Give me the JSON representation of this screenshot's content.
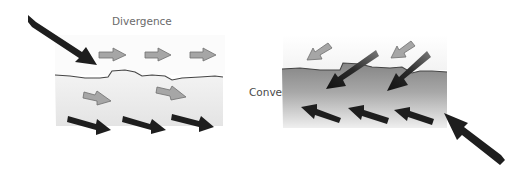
{
  "diagram": {
    "panels": [
      {
        "id": "divergence",
        "label": "Divergence",
        "water_colors": {
          "top": "#f2f2f2",
          "bottom": "#e6e6e6"
        },
        "arrows": {
          "wind": "large black arrow from upper-left pointing down-right toward surface",
          "surface": "three gray arrows pointing right, moving away",
          "subsurface_gray": "two gray arrows pointing right",
          "deep": "three black arrows pointing right-down"
        }
      },
      {
        "id": "convergence",
        "label": "Convergence",
        "water_colors": {
          "top": "#8a8a8a",
          "bottom": "#ececec"
        },
        "arrows": {
          "wind": "large black arrow from lower-right pointing up-left",
          "surface": "two gray arrows pointing down-left",
          "downwelling": "two large black arrows pointing down-left into water",
          "deep": "three black arrows pointing left-up"
        }
      }
    ],
    "colors": {
      "black_arrow": "#1e1e1e",
      "gray_arrow": "#a6a6a6",
      "gray_arrow_stroke": "#6e6e6e",
      "surface_line": "#444444",
      "label": "#6a6a6a"
    }
  }
}
